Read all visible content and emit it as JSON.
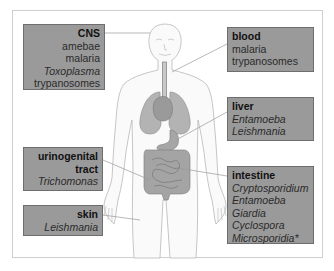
{
  "diagram": {
    "type": "anatomical-label-diagram",
    "boxes": [
      {
        "id": "cns",
        "title": "CNS",
        "align": "right",
        "items": [
          {
            "text": "amebae",
            "italic": false
          },
          {
            "text": "malaria",
            "italic": false
          },
          {
            "text": "Toxoplasma",
            "italic": true
          },
          {
            "text": "trypanosomes",
            "italic": false
          }
        ],
        "points_to": "head"
      },
      {
        "id": "blood",
        "title": "blood",
        "align": "left",
        "items": [
          {
            "text": "malaria",
            "italic": false
          },
          {
            "text": "trypanosomes",
            "italic": false
          }
        ],
        "points_to": "neck / blood vessels"
      },
      {
        "id": "liver",
        "title": "liver",
        "align": "left",
        "items": [
          {
            "text": "Entamoeba",
            "italic": true
          },
          {
            "text": "Leishmania",
            "italic": true
          }
        ],
        "points_to": "liver"
      },
      {
        "id": "urinogenital",
        "title": "urinogenital tract",
        "title_lines": [
          "urinogenital",
          "tract"
        ],
        "align": "right",
        "items": [
          {
            "text": "Trichomonas",
            "italic": true
          }
        ],
        "points_to": "pelvis"
      },
      {
        "id": "skin",
        "title": "skin",
        "align": "right",
        "items": [
          {
            "text": "Leishmania",
            "italic": true
          }
        ],
        "points_to": "thigh skin"
      },
      {
        "id": "intestine",
        "title": "intestine",
        "align": "left",
        "items": [
          {
            "text": "Cryptosporidium",
            "italic": true
          },
          {
            "text": "Entamoeba",
            "italic": true
          },
          {
            "text": "Giardia",
            "italic": true
          },
          {
            "text": "Cyclospora",
            "italic": true
          },
          {
            "text": "Microsporidia*",
            "italic": true
          }
        ],
        "points_to": "intestines"
      }
    ],
    "colors": {
      "box_fill": "#9a9a9a",
      "box_border": "#6e6e6e",
      "organ_fill": "#a9a9a9",
      "outline": "#b8b8b8",
      "frame": "#cfcfcf"
    }
  }
}
